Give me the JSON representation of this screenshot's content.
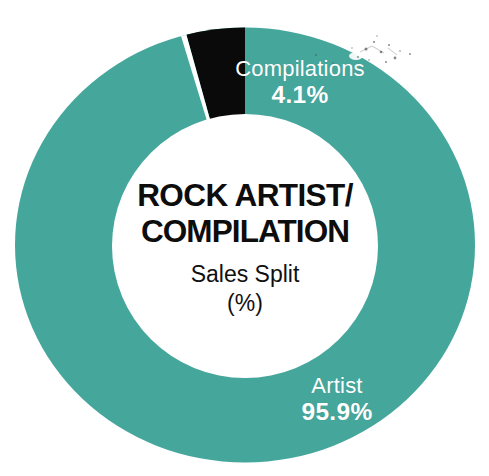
{
  "chart_data": {
    "type": "pie",
    "variant": "donut",
    "title": "ROCK ARTIST/ COMPILATION",
    "title_line1": "ROCK ARTIST/",
    "title_line2": "COMPILATION",
    "subtitle_line1": "Sales Split",
    "subtitle_line2": "(%)",
    "unit": "%",
    "categories": [
      "Artist",
      "Compilations"
    ],
    "values": [
      95.9,
      4.1
    ],
    "value_labels": [
      "95.9%",
      "4.1%"
    ],
    "colors": [
      "#45a69c",
      "#0a0a0a"
    ],
    "legend": "none",
    "slices": [
      {
        "label": "Artist",
        "value": 95.9,
        "value_label": "95.9%",
        "color": "#45a69c",
        "start_angle_deg": 0,
        "end_angle_deg": 345.2
      },
      {
        "label": "Compilations",
        "value": 4.1,
        "value_label": "4.1%",
        "color": "#0a0a0a",
        "start_angle_deg": 345.2,
        "end_angle_deg": 360
      }
    ],
    "label_color": "#ffffff",
    "background": "#ffffff",
    "grid": false,
    "total": 100.0
  },
  "center": {
    "title_line1": "ROCK ARTIST/",
    "title_line2": "COMPILATION",
    "subtitle_line1": "Sales Split",
    "subtitle_line2": "(%)"
  },
  "labels": {
    "compilations": {
      "name": "Compilations",
      "value": "4.1%"
    },
    "artist": {
      "name": "Artist",
      "value": "95.9%"
    }
  },
  "theme": {
    "accent_teal": "#45a69c",
    "segment_black": "#0a0a0a",
    "background": "#ffffff",
    "label_text": "#ffffff",
    "title_text": "#0d0d0d"
  }
}
